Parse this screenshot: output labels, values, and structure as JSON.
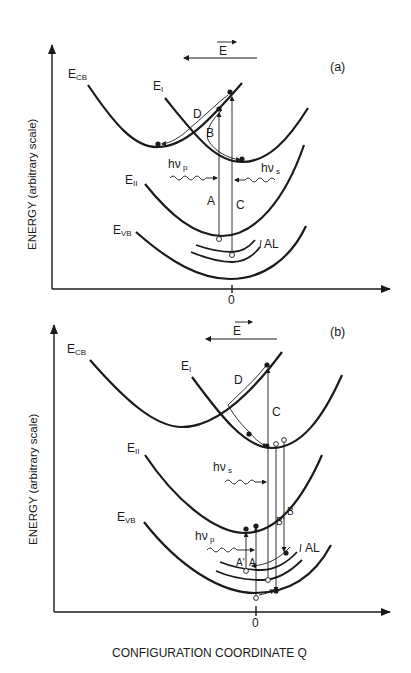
{
  "figure": {
    "x_axis_label": "CONFIGURATION COORDINATE Q",
    "colors": {
      "ink": "#1a1a1a",
      "background": "#ffffff"
    }
  },
  "panel_a": {
    "tag": "(a)",
    "y_axis_label": "ENERGY (arbitrary scale)",
    "x_tick": "0",
    "field_label": "E",
    "field_direction": "leftward",
    "curves": {
      "cb": {
        "main": "E",
        "sub": "CB"
      },
      "i": {
        "main": "E",
        "sub": "I"
      },
      "ii": {
        "main": "E",
        "sub": "II"
      },
      "vb": {
        "main": "E",
        "sub": "VB"
      }
    },
    "al_label": "AL",
    "photons": {
      "pump": {
        "main": "hν",
        "sub": "p"
      },
      "signal": {
        "main": "hν",
        "sub": "s"
      }
    },
    "transitions": {
      "A": "A",
      "B": "B",
      "C": "C",
      "D": "D"
    }
  },
  "panel_b": {
    "tag": "(b)",
    "y_axis_label": "ENERGY (arbitrary scale)",
    "x_tick": "0",
    "field_label": "E",
    "field_direction": "leftward",
    "curves": {
      "cb": {
        "main": "E",
        "sub": "CB"
      },
      "i": {
        "main": "E",
        "sub": "I"
      },
      "ii": {
        "main": "E",
        "sub": "II"
      },
      "vb": {
        "main": "E",
        "sub": "VB"
      }
    },
    "al_label": "AL",
    "photons": {
      "pump": {
        "main": "hν",
        "sub": "p"
      },
      "signal": {
        "main": "hν",
        "sub": "s"
      }
    },
    "transitions": {
      "A": "A",
      "A_prime": "A'",
      "B": "B",
      "B_prime": "B'",
      "C": "C",
      "D": "D"
    }
  }
}
